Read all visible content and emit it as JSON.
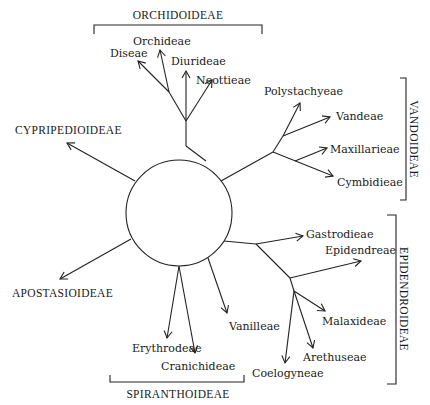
{
  "diagram": {
    "type": "phylogenetic-radial-tree",
    "center": "circle",
    "subfamilies": {
      "orchidoideae": "ORCHIDOIDEAE",
      "vandoideae": "VANDOIDEAE",
      "epidendroideae": "EPIDENDROIDEAE",
      "spiranthoideae": "SPIRANTHOIDEAE",
      "cypripedioideae": "CYPRIPEDIOIDEAE",
      "apostasioideae": "APOSTASIOIDEAE"
    },
    "tribes": {
      "orchideae": "Orchideae",
      "diseae": "Diseae",
      "diurideae": "Diurideae",
      "neottieae": "Neottieae",
      "polystachyeae": "Polystachyeae",
      "vandeae": "Vandeae",
      "maxillarieae": "Maxillarieae",
      "cymbidieae": "Cymbidieae",
      "gastrodieae": "Gastrodieae",
      "epidendreae": "Epidendreae",
      "malaxideae": "Malaxideae",
      "arethuseae": "Arethuseae",
      "coelogyneae": "Coelogyneae",
      "vanilleae": "Vanilleae",
      "erythrodeae": "Erythrodeae",
      "cranichideae": "Cranichideae"
    }
  }
}
